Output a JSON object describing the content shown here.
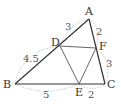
{
  "diagram": {
    "type": "geometry-triangle",
    "points": {
      "A": {
        "label": "A",
        "x": 89,
        "y": 19
      },
      "B": {
        "label": "B",
        "x": 15,
        "y": 84
      },
      "C": {
        "label": "C",
        "x": 105,
        "y": 84
      },
      "D": {
        "label": "D",
        "x": 60,
        "y": 46
      },
      "E": {
        "label": "E",
        "x": 79,
        "y": 84
      },
      "F": {
        "label": "F",
        "x": 96,
        "y": 48
      }
    },
    "segments": [
      [
        "A",
        "B"
      ],
      [
        "B",
        "C"
      ],
      [
        "C",
        "A"
      ],
      [
        "D",
        "F"
      ],
      [
        "D",
        "E"
      ],
      [
        "E",
        "F"
      ]
    ],
    "lengths": {
      "AD": "3",
      "DB": "4.5",
      "AF": "2",
      "FC": "3",
      "BE": "5",
      "EC": "2"
    },
    "colors": {
      "line": "#333333",
      "arc": "#aaaaaa",
      "text": "#333333"
    }
  }
}
